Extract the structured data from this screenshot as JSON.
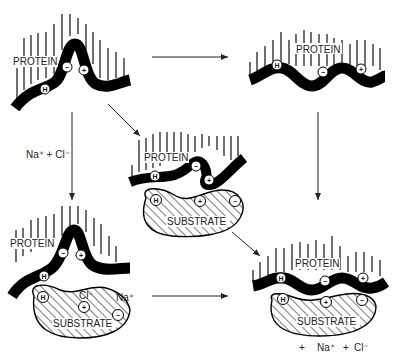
{
  "diagram": {
    "protein_label": "PROTEIN",
    "substrate_label": "SUBSTRATE",
    "hydrophobic_symbol": "H",
    "negative_symbol": "−",
    "positive_symbol": "+",
    "salt_label": "Na⁺ + Cl⁻",
    "panels": [
      {
        "id": "free-protein-folded",
        "labels": [
          "PROTEIN"
        ],
        "charges": [
          "H",
          "−",
          "+"
        ]
      },
      {
        "id": "free-protein-extended",
        "labels": [
          "PROTEIN"
        ],
        "charges": [
          "H",
          "−",
          "+"
        ]
      },
      {
        "id": "protein-substrate-initial",
        "labels": [
          "PROTEIN",
          "SUBSTRATE"
        ],
        "charges": [
          "H",
          "−",
          "+",
          "H",
          "+",
          "−"
        ]
      },
      {
        "id": "protein-substrate-with-salt",
        "labels": [
          "PROTEIN",
          "SUBSTRATE",
          "Cl⁻",
          "Na⁺"
        ],
        "charges": [
          "H",
          "−",
          "+",
          "H",
          "+",
          "−"
        ]
      },
      {
        "id": "protein-substrate-adsorbed",
        "labels": [
          "PROTEIN",
          "SUBSTRATE",
          "+ Na⁺ + Cl⁻"
        ],
        "charges": [
          "H",
          "−",
          "+",
          "H",
          "+",
          "−"
        ]
      }
    ],
    "counterions": {
      "cl": "Cl⁻",
      "na": "Na⁺"
    },
    "released_ions": {
      "plus": "+",
      "na": "Na⁺",
      "plus2": "+",
      "cl": "Cl⁻"
    }
  }
}
